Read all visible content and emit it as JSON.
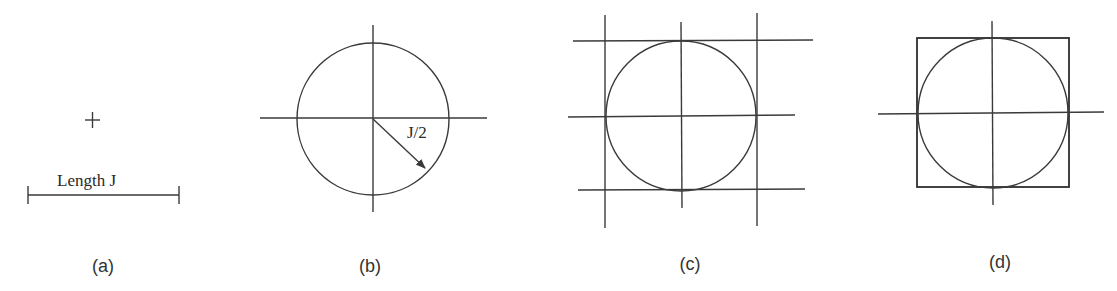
{
  "figure": {
    "panels": [
      {
        "id": "a",
        "caption": "(a)",
        "description": "Center point marked with a plus sign and a dimension bar of length J",
        "dimension_label": "Length J",
        "elements": [
          "center-point-plus",
          "length-dimension-bar"
        ]
      },
      {
        "id": "b",
        "caption": "(b)",
        "description": "Circle of radius J/2 drawn about the center with crosshair lines",
        "radius_label": "J/2",
        "elements": [
          "circle",
          "horizontal-axis",
          "vertical-axis",
          "radius-arrow"
        ]
      },
      {
        "id": "c",
        "caption": "(c)",
        "description": "Circle with tangent lines and center lines forming a grid",
        "elements": [
          "circle",
          "three-vertical-lines",
          "three-horizontal-lines"
        ]
      },
      {
        "id": "d",
        "caption": "(d)",
        "description": "Circle inscribed in a square with center crosshairs",
        "elements": [
          "circle",
          "bounding-square",
          "horizontal-axis",
          "vertical-axis"
        ]
      }
    ],
    "colors": {
      "line": "#3a3a3a",
      "text": "#2a2a2a",
      "background": "#ffffff"
    }
  }
}
